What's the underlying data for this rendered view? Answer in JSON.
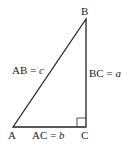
{
  "diagram": {
    "type": "right-triangle",
    "vertices": {
      "A": {
        "label": "A"
      },
      "B": {
        "label": "B"
      },
      "C": {
        "label": "C"
      }
    },
    "sides": {
      "AB": {
        "name": "AB",
        "eq": "=",
        "var": "c"
      },
      "BC": {
        "name": "BC",
        "eq": "=",
        "var": "a"
      },
      "AC": {
        "name": "AC",
        "eq": "=",
        "var": "b"
      }
    },
    "right_angle_at": "C",
    "line_color": "#222222"
  }
}
